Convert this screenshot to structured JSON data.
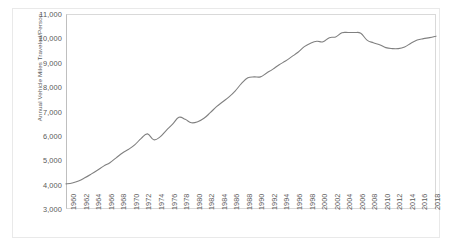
{
  "chart_data": {
    "type": "line",
    "title": "",
    "xlabel": "",
    "ylabel": "Annual Vehicle Miles Traveled/Person",
    "ylim": [
      3000,
      11000
    ],
    "ytick_step": 1000,
    "yticks": [
      "3,000",
      "4,000",
      "5,000",
      "6,000",
      "7,000",
      "8,000",
      "9,000",
      "10,000",
      "11,000"
    ],
    "ytick_values": [
      3000,
      4000,
      5000,
      6000,
      7000,
      8000,
      9000,
      10000,
      11000
    ],
    "xlim": [
      1960,
      2019
    ],
    "xticks": [
      "1960",
      "1962",
      "1964",
      "1966",
      "1968",
      "1970",
      "1972",
      "1974",
      "1976",
      "1978",
      "1980",
      "1982",
      "1984",
      "1986",
      "1988",
      "1990",
      "1992",
      "1994",
      "1996",
      "1998",
      "2000",
      "2002",
      "2004",
      "2006",
      "2008",
      "2010",
      "2012",
      "2014",
      "2016",
      "2018"
    ],
    "xtick_values": [
      1960,
      1962,
      1964,
      1966,
      1968,
      1970,
      1972,
      1974,
      1976,
      1978,
      1980,
      1982,
      1984,
      1986,
      1988,
      1990,
      1992,
      1994,
      1996,
      1998,
      2000,
      2002,
      2004,
      2006,
      2008,
      2010,
      2012,
      2014,
      2016,
      2018
    ],
    "grid": false,
    "legend": false,
    "legend_position": "none",
    "line_color": "#808080",
    "line_width": 1.1,
    "markers": false,
    "series": [
      {
        "name": "Annual Vehicle Miles Traveled/Person",
        "x": [
          1960,
          1961,
          1962,
          1963,
          1964,
          1965,
          1966,
          1967,
          1968,
          1969,
          1970,
          1971,
          1972,
          1973,
          1974,
          1975,
          1976,
          1977,
          1978,
          1979,
          1980,
          1981,
          1982,
          1983,
          1984,
          1985,
          1986,
          1987,
          1988,
          1989,
          1990,
          1991,
          1992,
          1993,
          1994,
          1995,
          1996,
          1997,
          1998,
          1999,
          2000,
          2001,
          2002,
          2003,
          2004,
          2005,
          2006,
          2007,
          2008,
          2009,
          2010,
          2011,
          2012,
          2013,
          2014,
          2015,
          2016,
          2017,
          2018,
          2019
        ],
        "values": [
          4030,
          4070,
          4150,
          4280,
          4430,
          4590,
          4760,
          4900,
          5100,
          5300,
          5450,
          5640,
          5900,
          6080,
          5840,
          5960,
          6230,
          6480,
          6760,
          6680,
          6540,
          6580,
          6720,
          6950,
          7200,
          7400,
          7600,
          7850,
          8150,
          8380,
          8420,
          8420,
          8580,
          8740,
          8920,
          9070,
          9250,
          9430,
          9660,
          9800,
          9880,
          9860,
          10030,
          10060,
          10230,
          10240,
          10240,
          10210,
          9930,
          9820,
          9740,
          9620,
          9580,
          9580,
          9650,
          9800,
          9930,
          9990,
          10030,
          10090
        ]
      }
    ]
  }
}
